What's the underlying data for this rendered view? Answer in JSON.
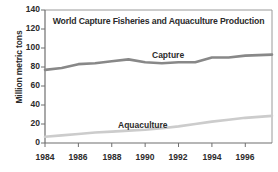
{
  "chart_data": {
    "type": "line",
    "title": "World Capture Fisheries and Aquaculture Production",
    "xlabel": "",
    "ylabel": "Million metric tons",
    "xlim": [
      1984,
      1997.6
    ],
    "ylim": [
      0,
      140
    ],
    "xticks": [
      1984,
      1986,
      1988,
      1990,
      1992,
      1994,
      1996
    ],
    "xtick_labels": [
      "1984",
      "1986",
      "1988",
      "1990",
      "1992",
      "1994",
      "1996"
    ],
    "yticks": [
      0,
      20,
      40,
      60,
      80,
      100,
      120,
      140
    ],
    "ytick_labels": [
      "0",
      "20",
      "40",
      "60",
      "80",
      "100",
      "120",
      "140"
    ],
    "grid": false,
    "legend": "inline-labels",
    "x": [
      1984,
      1985,
      1986,
      1987,
      1988,
      1989,
      1990,
      1991,
      1992,
      1993,
      1994,
      1995,
      1996,
      1997.6
    ],
    "series": [
      {
        "name": "Capture",
        "color": "#888888",
        "values": [
          77,
          79,
          83,
          84,
          86,
          88,
          85,
          84,
          85,
          85,
          90,
          90,
          92,
          93
        ]
      },
      {
        "name": "Aquaculture",
        "color": "#cccccc",
        "values": [
          6.5,
          8,
          9.5,
          11,
          12,
          13,
          14,
          15.5,
          17.5,
          20,
          22.5,
          24.5,
          26.5,
          28.5
        ]
      }
    ],
    "annotations": [
      {
        "text": "Capture",
        "x": 1990.5,
        "y": 100
      },
      {
        "text": "Aquaculture",
        "x": 1988.4,
        "y": 32
      }
    ]
  },
  "axis": {
    "y_title": "Million metric tons"
  },
  "colors": {
    "capture": "#888888",
    "aquaculture": "#cccccc",
    "axis": "#7a7a7a",
    "text": "#2b2b2b",
    "background": "#ffffff"
  }
}
